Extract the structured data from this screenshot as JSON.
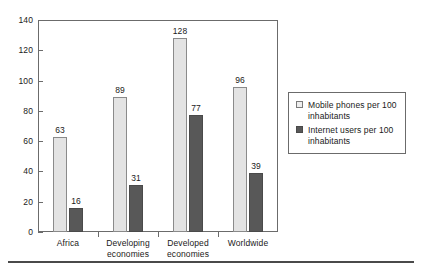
{
  "chart_data": {
    "type": "bar",
    "title": "",
    "subtitle": "",
    "xlabel": "",
    "ylabel": "",
    "categories": [
      "Africa",
      "Developing\neconomies",
      "Developed\neconomies",
      "Worldwide"
    ],
    "series": [
      {
        "name": "Mobile phones per 100 inhabitants",
        "values": [
          63,
          89,
          128,
          96
        ],
        "color": "#e3e3e3"
      },
      {
        "name": "Internet users per 100 inhabitants",
        "values": [
          16,
          31,
          77,
          39
        ],
        "color": "#585858"
      }
    ],
    "ylim": [
      0,
      140
    ],
    "y_ticks": [
      0,
      20,
      40,
      60,
      80,
      100,
      120,
      140
    ],
    "y_tick_labels": [
      "0",
      "20",
      "40",
      "60",
      "80",
      "100",
      "120",
      "140"
    ],
    "grid": false,
    "legend_position": "right",
    "data_labels": true
  },
  "legend": {
    "entries": [
      {
        "label": "Mobile phones per 100 inhabitants"
      },
      {
        "label": "Internet users per 100 inhabitants"
      }
    ]
  }
}
